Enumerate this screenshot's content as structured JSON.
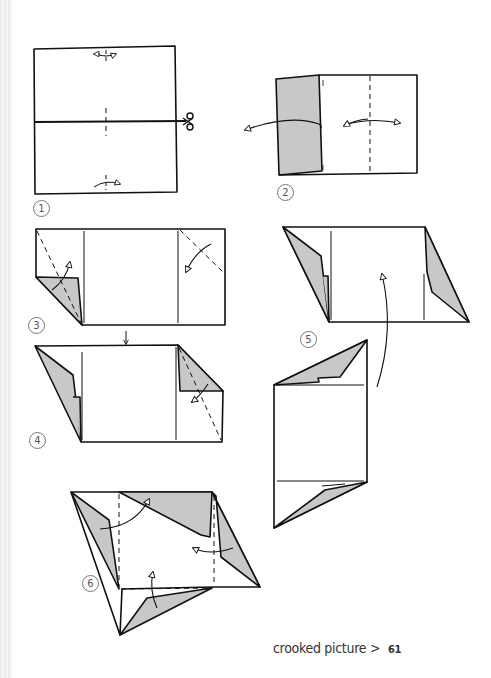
{
  "page": {
    "title": "crooked picture",
    "separator": ">",
    "page_number": "61"
  },
  "steps": [
    {
      "number": "1"
    },
    {
      "number": "2"
    },
    {
      "number": "3"
    },
    {
      "number": "4"
    },
    {
      "number": "5"
    },
    {
      "number": "6"
    }
  ],
  "colors": {
    "line": "#111111",
    "shade": "#c8c8c8",
    "paper": "#ffffff"
  }
}
